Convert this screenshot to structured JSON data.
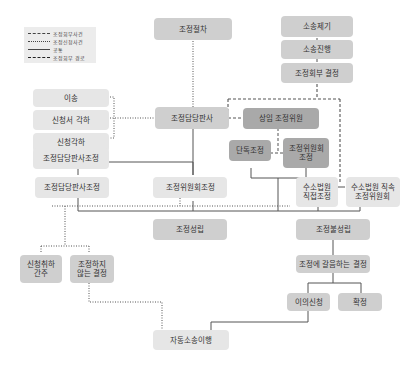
{
  "legend": {
    "items": [
      {
        "label": "조정회부사건",
        "style": "long-dash"
      },
      {
        "label": "조정신청사건",
        "style": "dotted"
      },
      {
        "label": "공통",
        "style": "solid"
      },
      {
        "label": "조정회부 경로",
        "style": "dashed"
      }
    ]
  },
  "nodes": {
    "jojeong_jeolcha": "조정절차",
    "sosong_jegi": "소송제기",
    "sosong_jinhaeng": "소송진행",
    "jojeong_hoebu_gyeoljeong": "조정회부 결정",
    "isong": "이송",
    "sincheongseo_gakha": "신청서 각하",
    "sincheong_gakha": "신청각하",
    "jojeong_damdang_pansa": "조정담당판사",
    "sangim_jojeong_wiwon": "상임 조정위원",
    "dandok_jojeong": "단독조정",
    "jojeong_wiwonhoe_jojeong_box": "조정위원회\n조정",
    "damdang_pansa_jojeong": "조정담당판사조정",
    "wiwonhoe_jojeong": "조정위원회조정",
    "suso_beobwon_jikjeop": "수소법원\n직접조정",
    "suso_beobwon_jiksok": "수소법원 직속\n조정위원회",
    "jojeong_seongnip": "조정성립",
    "jojeong_bulseongnip": "조정불성립",
    "sincheong_chwiha": "신청취하\n간주",
    "jojeong_haji_anneun": "조정하지\n않는 결정",
    "jojeong_gal_gyeoljeong": "조정에 갈음하는 결정",
    "iui_sincheong": "이의신청",
    "hwakjeong": "확정",
    "jadong_sosong": "자동소송이행"
  },
  "colors": {
    "light": "#e6e6e6",
    "medium": "#cfcfcf",
    "dark": "#a9a9a9",
    "line": "#555555"
  }
}
